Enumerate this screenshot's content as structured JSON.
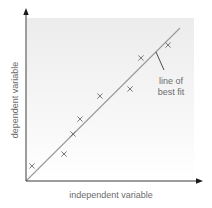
{
  "chart_data": {
    "type": "scatter",
    "title": "",
    "xlabel": "independent variable",
    "ylabel": "dependent variable",
    "xlim": [
      0,
      10
    ],
    "ylim": [
      0,
      10
    ],
    "grid": false,
    "legend": null,
    "tick_labels": {
      "x": [],
      "y": []
    },
    "series": [
      {
        "name": "data points",
        "marker": "x",
        "points": [
          {
            "x": 0.34,
            "y": 0.87
          },
          {
            "x": 2.16,
            "y": 1.56
          },
          {
            "x": 2.67,
            "y": 2.72
          },
          {
            "x": 3.07,
            "y": 3.58
          },
          {
            "x": 4.2,
            "y": 4.91
          },
          {
            "x": 5.91,
            "y": 5.32
          },
          {
            "x": 6.53,
            "y": 7.11
          },
          {
            "x": 8.07,
            "y": 7.86
          }
        ]
      },
      {
        "name": "line of best fit",
        "type": "line",
        "points": [
          {
            "x": 0,
            "y": 0
          },
          {
            "x": 8.75,
            "y": 8.84
          }
        ]
      }
    ],
    "annotations": [
      {
        "text": "line of best fit",
        "lines": [
          "line of",
          "best fit"
        ],
        "points_to": "line of best fit"
      }
    ]
  },
  "plot": {
    "origin_px": [
      26,
      181
    ],
    "x_scale_px_per_unit": 17.6,
    "y_scale_px_per_unit": 17.3,
    "colors": {
      "axis": "#3a3a3a",
      "line": "#9a9a9a",
      "marker": "#6a6a6a",
      "text": "#6b6b6b",
      "shade_top": "#ececec",
      "shade_bottom": "#ffffff"
    }
  },
  "labels": {
    "x_axis": "independent variable",
    "y_axis": "dependent variable",
    "annotation_line1": "line of",
    "annotation_line2": "best fit"
  }
}
